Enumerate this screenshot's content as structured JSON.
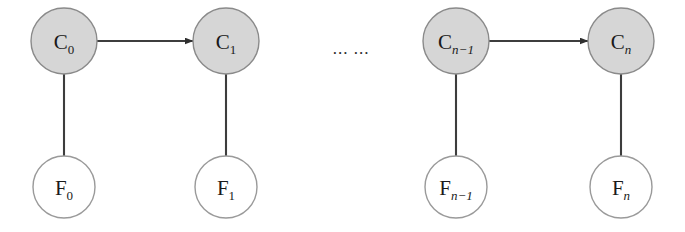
{
  "diagram": {
    "type": "chain-graph",
    "canvas": {
      "width": 685,
      "height": 232,
      "background": "#ffffff"
    },
    "style": {
      "hidden_node_fill": "#d6d6d6",
      "hidden_node_stroke": "#8a8a8a",
      "observed_node_fill": "#ffffff",
      "observed_node_stroke": "#9a9a9a",
      "edge_color": "#3d3d3d",
      "text_color": "#1a1a1a"
    },
    "hidden_nodes": [
      {
        "id": "C0",
        "base": "C",
        "sub": "0",
        "sub_italic": false,
        "cx": 64,
        "cy": 41,
        "r": 33
      },
      {
        "id": "C1",
        "base": "C",
        "sub": "1",
        "sub_italic": false,
        "cx": 226,
        "cy": 41,
        "r": 33
      },
      {
        "id": "Cn-1",
        "base": "C",
        "sub": "n−1",
        "sub_italic": true,
        "cx": 456,
        "cy": 41,
        "r": 33
      },
      {
        "id": "Cn",
        "base": "C",
        "sub": "n",
        "sub_italic": true,
        "cx": 621,
        "cy": 41,
        "r": 33
      }
    ],
    "observed_nodes": [
      {
        "id": "F0",
        "base": "F",
        "sub": "0",
        "sub_italic": false,
        "cx": 64,
        "cy": 187,
        "r": 31
      },
      {
        "id": "F1",
        "base": "F",
        "sub": "1",
        "sub_italic": false,
        "cx": 226,
        "cy": 187,
        "r": 31
      },
      {
        "id": "Fn-1",
        "base": "F",
        "sub": "n−1",
        "sub_italic": true,
        "cx": 456,
        "cy": 187,
        "r": 31
      },
      {
        "id": "Fn",
        "base": "F",
        "sub": "n",
        "sub_italic": true,
        "cx": 621,
        "cy": 187,
        "r": 31
      }
    ],
    "directed_edges": [
      {
        "id": "C0-to-C1",
        "from": "C0",
        "to": "C1",
        "x1": 97,
        "y1": 41,
        "x2": 193,
        "y2": 41
      },
      {
        "id": "Cn-1-to-Cn",
        "from": "Cn-1",
        "to": "Cn",
        "x1": 489,
        "y1": 41,
        "x2": 588,
        "y2": 41
      }
    ],
    "undirected_edges": [
      {
        "id": "C0-to-F0",
        "from": "C0",
        "to": "F0",
        "x1": 64,
        "y1": 74,
        "x2": 64,
        "y2": 156
      },
      {
        "id": "C1-to-F1",
        "from": "C1",
        "to": "F1",
        "x1": 226,
        "y1": 74,
        "x2": 226,
        "y2": 156
      },
      {
        "id": "Cn-1-to-Fn-1",
        "from": "Cn-1",
        "to": "Fn-1",
        "x1": 456,
        "y1": 74,
        "x2": 456,
        "y2": 156
      },
      {
        "id": "Cn-to-Fn",
        "from": "Cn",
        "to": "Fn",
        "x1": 621,
        "y1": 74,
        "x2": 621,
        "y2": 156
      }
    ],
    "ellipsis": {
      "id": "chain-ellipsis",
      "text": "... ...",
      "cx": 351,
      "cy": 54
    }
  }
}
